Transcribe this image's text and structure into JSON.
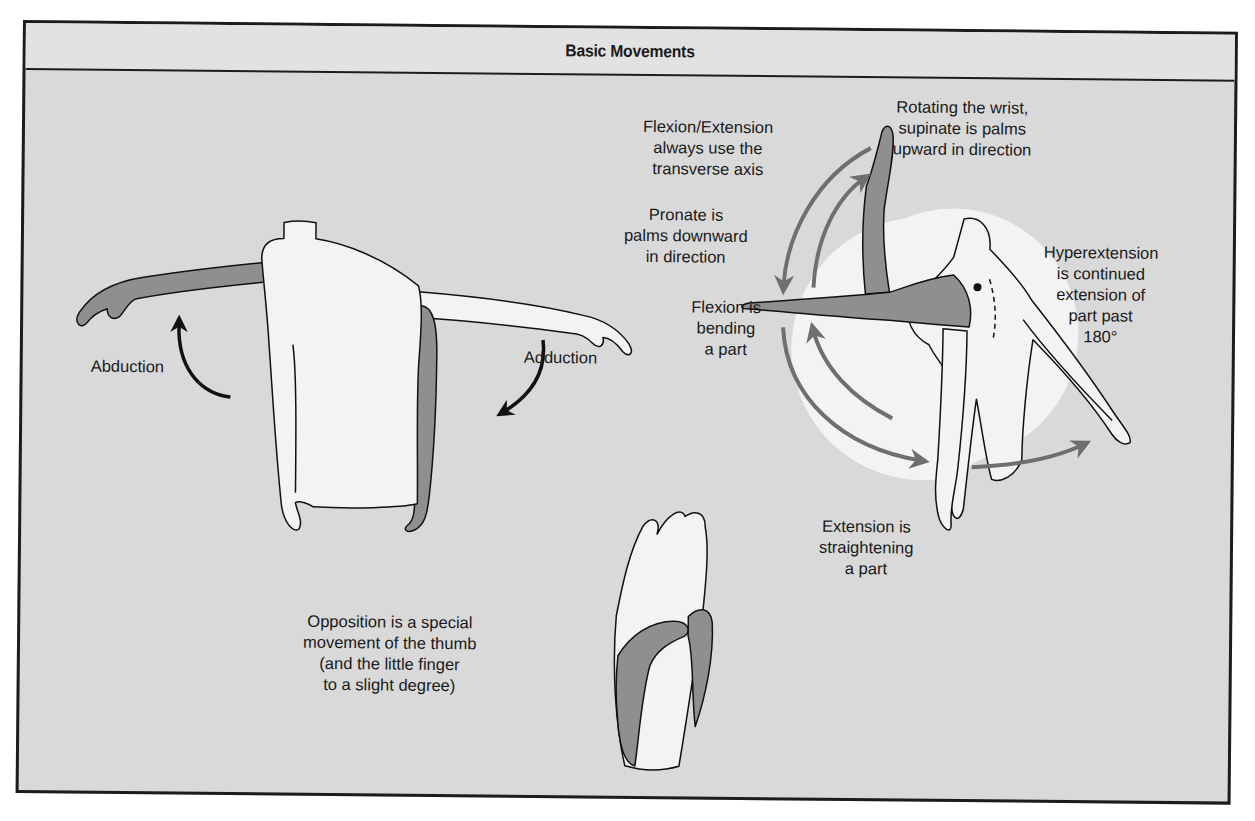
{
  "header": {
    "title": "Basic Movements"
  },
  "colors": {
    "panel_bg": "#d9d9d9",
    "header_bg": "#e2e2e2",
    "border": "#1c1c1c",
    "body_fill": "#f3f3f3",
    "highlight_limb": "#8f8f8f",
    "arrow_gray": "#6f6f6f",
    "arrow_black": "#111111"
  },
  "figures": [
    {
      "id": "abduction-adduction",
      "description": "Torso with arms outstretched and one arm lowered, showing abduction and adduction"
    },
    {
      "id": "flexion-extension",
      "description": "Side view figure with arm raised, horizontal and lowered, and circular arrows for flexion, extension, hyperextension, and rotation"
    },
    {
      "id": "opposition",
      "description": "Hand with thumb touching fingertips, showing opposition"
    }
  ],
  "labels": {
    "abduction": "Abduction",
    "adduction": "Adduction",
    "flexion_extension_axis": "Flexion/Extension\nalways use the\ntransverse axis",
    "rotating_wrist": "Rotating the wrist,\nsupinate is palms\nupward in direction",
    "pronate": "Pronate is\npalms downward\nin direction",
    "hyperextension": "Hyperextension\nis continued\nextension of\npart past\n180°",
    "flexion": "Flexion is\nbending\na part",
    "extension": "Extension is\nstraightening\na part",
    "opposition": "Opposition is a special\nmovement of the thumb\n(and the little finger\nto a slight degree)"
  }
}
